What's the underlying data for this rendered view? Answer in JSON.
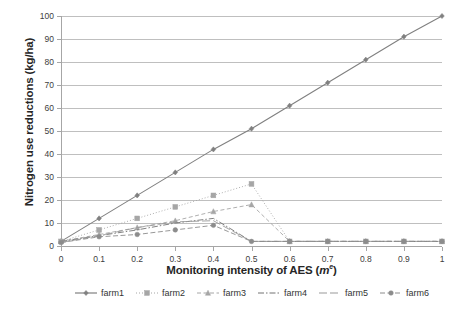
{
  "chart_data": {
    "type": "line",
    "title": "",
    "xlabel": "Monitoring intensity of AES (mᵉ)",
    "ylabel": "Nitrogen use reductions (kg/ha)",
    "x": [
      0,
      0.1,
      0.2,
      0.3,
      0.4,
      0.5,
      0.6,
      0.7,
      0.8,
      0.9,
      1
    ],
    "xtick_labels": [
      "0",
      "0.1",
      "0.2",
      "0.3",
      "0.4",
      "0.5",
      "0.6",
      "0.7",
      "0.8",
      "0.9",
      "1"
    ],
    "ytick_labels": [
      "0",
      "10",
      "20",
      "30",
      "40",
      "50",
      "60",
      "70",
      "80",
      "90",
      "100"
    ],
    "xlim": [
      0,
      1
    ],
    "ylim": [
      0,
      100
    ],
    "grid": "horizontal",
    "legend_position": "bottom",
    "series": [
      {
        "name": "farm1",
        "values": [
          2,
          12,
          22,
          32,
          42,
          51,
          61,
          71,
          81,
          91,
          100
        ],
        "color": "#808080",
        "line_style": "solid",
        "marker": "diamond"
      },
      {
        "name": "farm2",
        "values": [
          2,
          7,
          12,
          17,
          22,
          27,
          2,
          2,
          2,
          2,
          2
        ],
        "color": "#a6a6a6",
        "line_style": "dotted",
        "marker": "square"
      },
      {
        "name": "farm3",
        "values": [
          2,
          5,
          8,
          11,
          15,
          18,
          2,
          2,
          2,
          2,
          2
        ],
        "color": "#a6a6a6",
        "line_style": "dashed",
        "marker": "triangle"
      },
      {
        "name": "farm4",
        "values": [
          2,
          4.5,
          7,
          10,
          12,
          2,
          2,
          2,
          2,
          2,
          2
        ],
        "color": "#737373",
        "line_style": "dash-dot",
        "marker": "none"
      },
      {
        "name": "farm5",
        "values": [
          1.5,
          4.5,
          8,
          10.5,
          11,
          2,
          2,
          2,
          2,
          2,
          2
        ],
        "color": "#999999",
        "line_style": "long-dash",
        "marker": "none"
      },
      {
        "name": "farm6",
        "values": [
          1.5,
          4,
          5,
          7,
          9,
          2,
          2,
          2,
          2,
          2,
          2
        ],
        "color": "#8c8c8c",
        "line_style": "dash",
        "marker": "circle"
      }
    ]
  },
  "legend": {
    "items": [
      {
        "label": "farm1"
      },
      {
        "label": "farm2"
      },
      {
        "label": "farm3"
      },
      {
        "label": "farm4"
      },
      {
        "label": "farm5"
      },
      {
        "label": "farm6"
      }
    ]
  },
  "axis": {
    "y_title": "Nitrogen use reductions (kg/ha)",
    "x_title_main": "Monitoring intensity of AES (",
    "x_title_unit": "m",
    "x_title_sup": "e",
    "x_title_tail": ")"
  },
  "colors": {
    "gridline": "#bfbfbf",
    "axis": "#a6a6a6",
    "text": "#404040",
    "title": "#262626"
  }
}
